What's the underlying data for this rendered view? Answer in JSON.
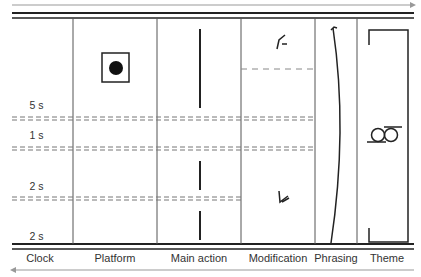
{
  "diagram": {
    "columns": [
      {
        "id": "clock",
        "label": "Clock"
      },
      {
        "id": "platform",
        "label": "Platform"
      },
      {
        "id": "main_action",
        "label": "Main action"
      },
      {
        "id": "modification",
        "label": "Modification"
      },
      {
        "id": "phrasing",
        "label": "Phrasing"
      },
      {
        "id": "theme",
        "label": "Theme"
      }
    ],
    "clock_marks": [
      {
        "label": "5 s"
      },
      {
        "label": "1 s"
      },
      {
        "label": "2 s"
      },
      {
        "label": "2 s"
      }
    ],
    "time_arrow_top": "right",
    "time_arrow_bottom": "left",
    "symbols": {
      "platform": "square-with-dot-icon",
      "main_action": "vertical-bar-icon",
      "modification_top": "hook-symbol-icon",
      "modification_bottom": "arrow-down-left-symbol-icon",
      "phrasing": "phrasing-bow-icon",
      "theme": "theme-bracket-with-rings-icon"
    }
  }
}
